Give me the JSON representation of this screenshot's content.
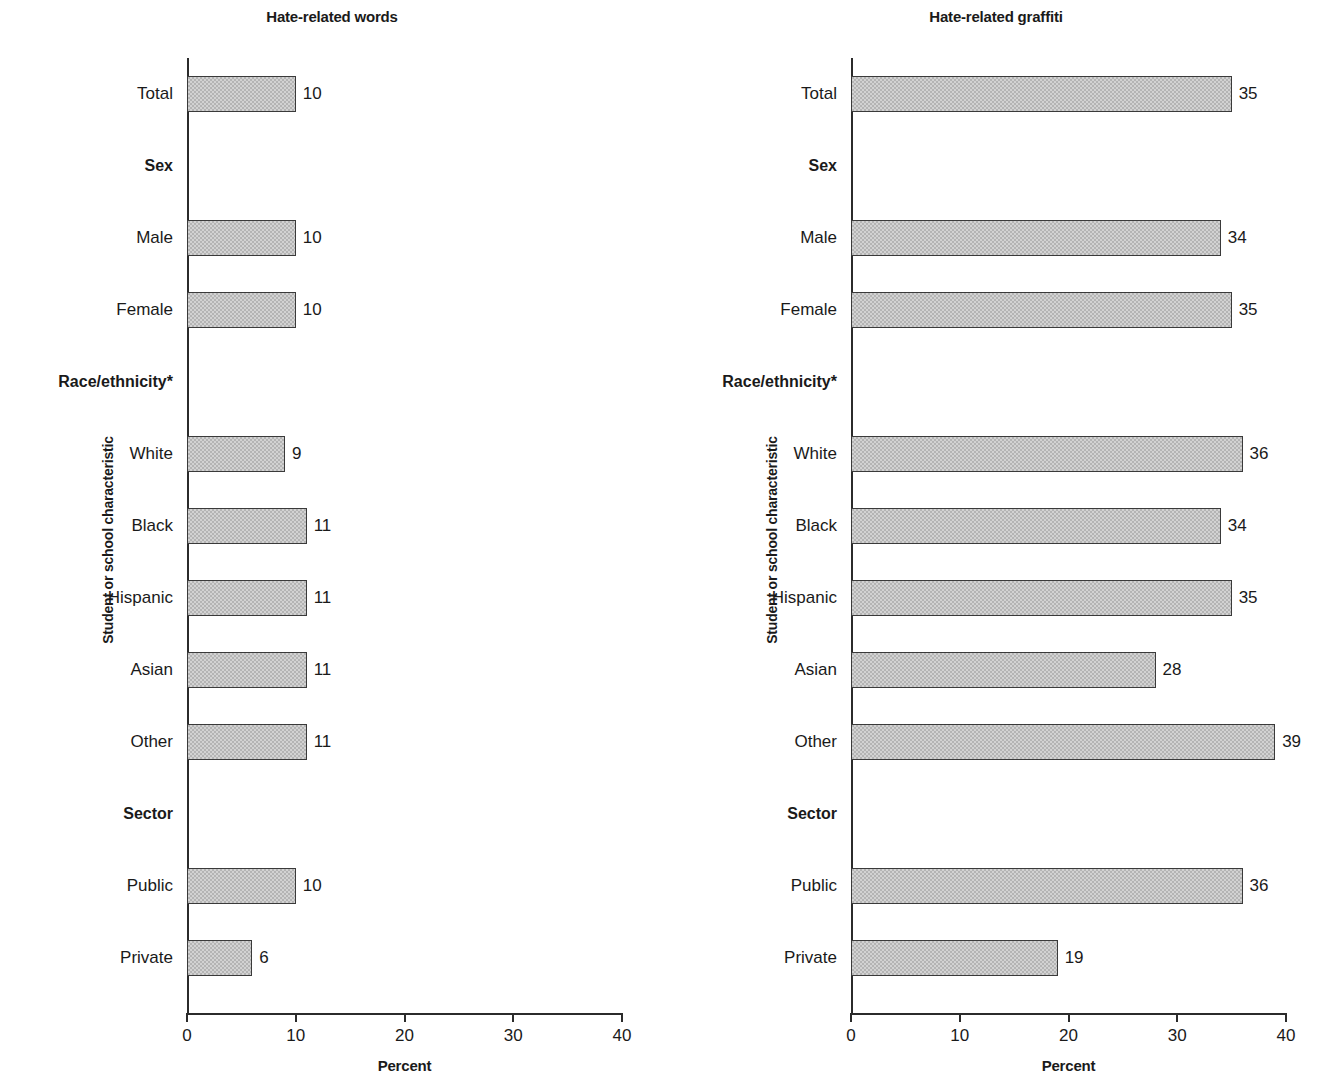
{
  "figure": {
    "yaxis_title": "Student or school characteristic",
    "xaxis_title": "Percent"
  },
  "chart_data": [
    {
      "type": "bar",
      "orientation": "horizontal",
      "title": "Hate-related words",
      "xlabel": "Percent",
      "ylabel": "Student or school characteristic",
      "xlim": [
        0,
        40
      ],
      "xticks": [
        0,
        10,
        20,
        30,
        40
      ],
      "xticklabels": [
        "0",
        "10",
        "20",
        "30",
        "40"
      ],
      "grid": false,
      "legend": false,
      "rows": [
        {
          "label": "Total",
          "kind": "bar",
          "value": 10,
          "value_label": "10"
        },
        {
          "label": "Sex",
          "kind": "group",
          "value": null,
          "value_label": ""
        },
        {
          "label": "Male",
          "kind": "bar",
          "value": 10,
          "value_label": "10"
        },
        {
          "label": "Female",
          "kind": "bar",
          "value": 10,
          "value_label": "10"
        },
        {
          "label": "Race/ethnicity*",
          "kind": "group",
          "value": null,
          "value_label": ""
        },
        {
          "label": "White",
          "kind": "bar",
          "value": 9,
          "value_label": "9"
        },
        {
          "label": "Black",
          "kind": "bar",
          "value": 11,
          "value_label": "11"
        },
        {
          "label": "Hispanic",
          "kind": "bar",
          "value": 11,
          "value_label": "11"
        },
        {
          "label": "Asian",
          "kind": "bar",
          "value": 11,
          "value_label": "11"
        },
        {
          "label": "Other",
          "kind": "bar",
          "value": 11,
          "value_label": "11"
        },
        {
          "label": "Sector",
          "kind": "group",
          "value": null,
          "value_label": ""
        },
        {
          "label": "Public",
          "kind": "bar",
          "value": 10,
          "value_label": "10"
        },
        {
          "label": "Private",
          "kind": "bar",
          "value": 6,
          "value_label": "6"
        }
      ],
      "categories": [
        "Total",
        "Male",
        "Female",
        "White",
        "Black",
        "Hispanic",
        "Asian",
        "Other",
        "Public",
        "Private"
      ],
      "values": [
        10,
        10,
        10,
        9,
        11,
        11,
        11,
        11,
        10,
        6
      ]
    },
    {
      "type": "bar",
      "orientation": "horizontal",
      "title": "Hate-related graffiti",
      "xlabel": "Percent",
      "ylabel": "Student or school characteristic",
      "xlim": [
        0,
        40
      ],
      "xticks": [
        0,
        10,
        20,
        30,
        40
      ],
      "xticklabels": [
        "0",
        "10",
        "20",
        "30",
        "40"
      ],
      "grid": false,
      "legend": false,
      "rows": [
        {
          "label": "Total",
          "kind": "bar",
          "value": 35,
          "value_label": "35"
        },
        {
          "label": "Sex",
          "kind": "group",
          "value": null,
          "value_label": ""
        },
        {
          "label": "Male",
          "kind": "bar",
          "value": 34,
          "value_label": "34"
        },
        {
          "label": "Female",
          "kind": "bar",
          "value": 35,
          "value_label": "35"
        },
        {
          "label": "Race/ethnicity*",
          "kind": "group",
          "value": null,
          "value_label": ""
        },
        {
          "label": "White",
          "kind": "bar",
          "value": 36,
          "value_label": "36"
        },
        {
          "label": "Black",
          "kind": "bar",
          "value": 34,
          "value_label": "34"
        },
        {
          "label": "Hispanic",
          "kind": "bar",
          "value": 35,
          "value_label": "35"
        },
        {
          "label": "Asian",
          "kind": "bar",
          "value": 28,
          "value_label": "28"
        },
        {
          "label": "Other",
          "kind": "bar",
          "value": 39,
          "value_label": "39"
        },
        {
          "label": "Sector",
          "kind": "group",
          "value": null,
          "value_label": ""
        },
        {
          "label": "Public",
          "kind": "bar",
          "value": 36,
          "value_label": "36"
        },
        {
          "label": "Private",
          "kind": "bar",
          "value": 19,
          "value_label": "19"
        }
      ],
      "categories": [
        "Total",
        "Male",
        "Female",
        "White",
        "Black",
        "Hispanic",
        "Asian",
        "Other",
        "Public",
        "Private"
      ],
      "values": [
        35,
        34,
        35,
        36,
        34,
        35,
        28,
        39,
        36,
        19
      ]
    }
  ],
  "colors": {
    "bar_fill": "#b4b4b4",
    "bar_border": "#3a3a3a",
    "axis": "#2b2b2b",
    "text": "#1a1a1a",
    "background": "#ffffff"
  }
}
